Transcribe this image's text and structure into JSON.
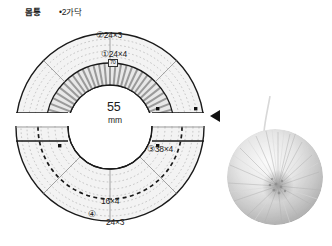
{
  "header": {
    "body_part_label": "몸통",
    "strands_label": "•2가닥"
  },
  "diagram": {
    "name": "pom-pom-template-diagram",
    "outer_top_label": "②24×3",
    "inner_top_label": "①24×4",
    "inner_top_small_label": "70",
    "center_value": "55",
    "center_unit": "mm",
    "right_label": "③38×4",
    "bottom_inner_label": "16×4",
    "bottom_circle_marker": "④",
    "bottom_outer_label": "24×3"
  },
  "photo": {
    "name": "finished-pompom-photo",
    "alt": "white pom-pom"
  },
  "arrow": {
    "name": "direction-arrow-marker"
  },
  "colors": {
    "outline": "#1a1a1a",
    "ring_fill": "#f2f2f2",
    "band_fill": "#e3e3e3",
    "stripe": "#9a9a9a",
    "dotted": "#b4b4b4",
    "marker": "#111111",
    "pompom_light": "#f4f4f4",
    "pompom_mid": "#cfcfcf",
    "pompom_dark": "#9d9d9d"
  }
}
